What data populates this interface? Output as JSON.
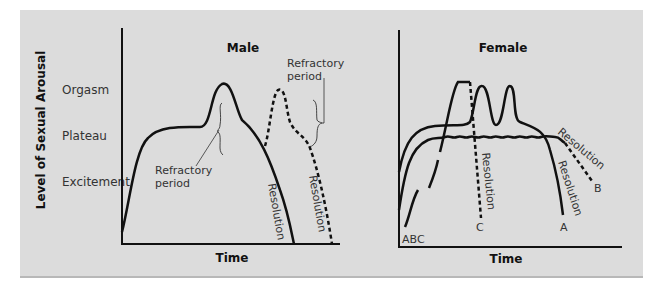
{
  "figure": {
    "y_axis_title": "Level of Sexual Arousal",
    "y_levels": [
      "Orgasm",
      "Plateau",
      "Excitement"
    ],
    "male": {
      "title": "Male",
      "x_label": "Time",
      "annotations": {
        "refractory_inner": "Refractory period",
        "refractory_outer": "Refractory period",
        "resolution_solid": "Resolution",
        "resolution_dashed": "Resolution"
      }
    },
    "female": {
      "title": "Female",
      "x_label": "Time",
      "curve_labels": {
        "start": "ABC",
        "a": "A",
        "b": "B",
        "c": "C"
      },
      "annotations": {
        "resolution_c": "Resolution",
        "resolution_a": "Resolution",
        "resolution_b": "Resolution"
      }
    },
    "colors": {
      "background": "#dcdcdc",
      "ink": "#111111",
      "text": "#333333"
    }
  }
}
